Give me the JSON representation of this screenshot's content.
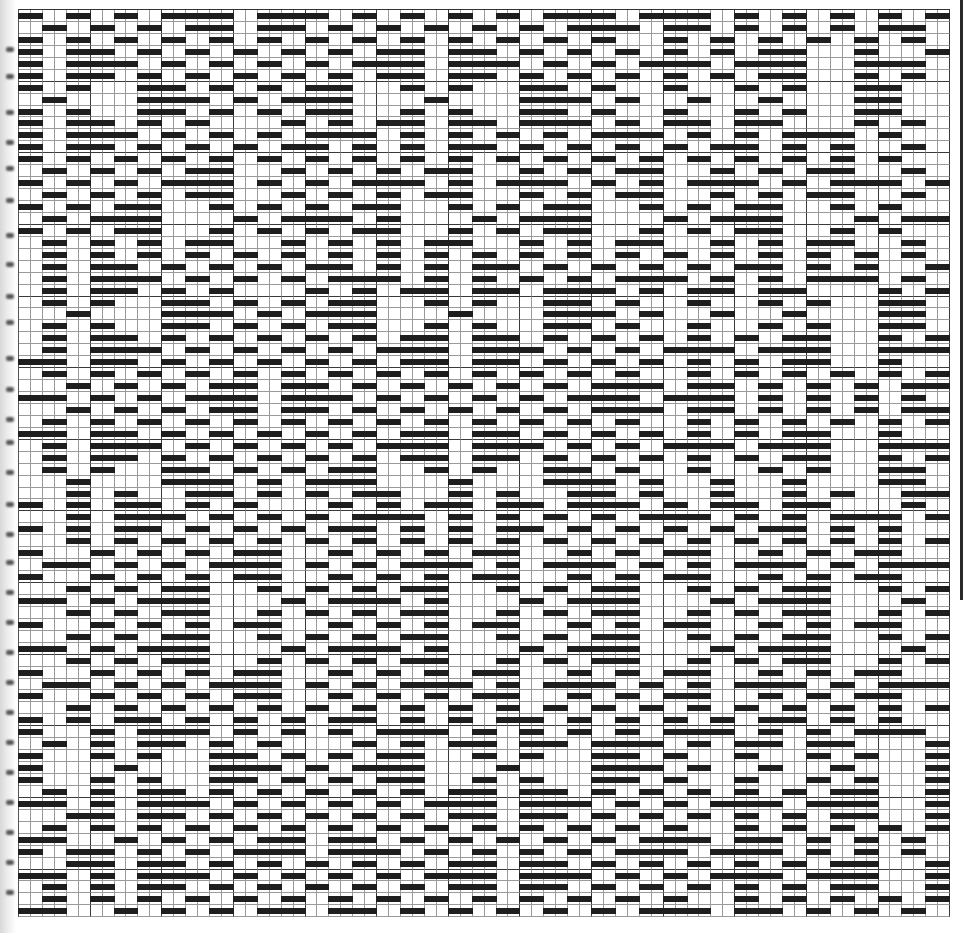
{
  "document": {
    "type": "weaving-drawdown-grid",
    "columns": 78,
    "rows": 76,
    "cell_width_px": 11.95,
    "cell_height_px": 11.95,
    "major_line_every": 6,
    "fill_color": "#1e1e1e",
    "grid_line_color": "#9a9a9a",
    "major_line_color": "#3a3a3a",
    "background": "#ffffff"
  },
  "base_rows": [
    [
      [
        0,
        1
      ],
      [
        4,
        5
      ],
      [
        8,
        9
      ],
      [
        12,
        17
      ],
      [
        20,
        25
      ],
      [
        28,
        29
      ],
      [
        32,
        33
      ],
      [
        36,
        37
      ],
      [
        40,
        41
      ],
      [
        44,
        49
      ],
      [
        52,
        57
      ],
      [
        60,
        61
      ],
      [
        64,
        65
      ],
      [
        68,
        69
      ],
      [
        72,
        73
      ],
      [
        76,
        77
      ]
    ],
    [
      [
        2,
        3
      ],
      [
        6,
        7
      ],
      [
        10,
        11
      ],
      [
        14,
        17
      ],
      [
        20,
        23
      ],
      [
        26,
        27
      ],
      [
        30,
        31
      ],
      [
        34,
        35
      ],
      [
        38,
        39
      ],
      [
        42,
        43
      ],
      [
        46,
        51
      ],
      [
        54,
        57
      ],
      [
        60,
        61
      ],
      [
        64,
        65
      ],
      [
        68,
        69
      ],
      [
        72,
        75
      ]
    ],
    [
      [
        0,
        1
      ],
      [
        4,
        5
      ],
      [
        8,
        9
      ],
      [
        12,
        13
      ],
      [
        16,
        17
      ],
      [
        20,
        21
      ],
      [
        24,
        25
      ],
      [
        28,
        29
      ],
      [
        32,
        33
      ],
      [
        36,
        37
      ],
      [
        40,
        41
      ],
      [
        44,
        45
      ],
      [
        48,
        49
      ],
      [
        54,
        55
      ],
      [
        58,
        59
      ],
      [
        62,
        63
      ],
      [
        66,
        67
      ],
      [
        70,
        71
      ],
      [
        74,
        75
      ]
    ],
    [
      [
        0,
        1
      ],
      [
        4,
        7
      ],
      [
        10,
        11
      ],
      [
        14,
        15
      ],
      [
        18,
        19
      ],
      [
        22,
        23
      ],
      [
        26,
        27
      ],
      [
        30,
        33
      ],
      [
        36,
        39
      ],
      [
        42,
        43
      ],
      [
        46,
        47
      ],
      [
        50,
        51
      ],
      [
        54,
        55
      ],
      [
        58,
        59
      ],
      [
        62,
        65
      ],
      [
        70,
        71
      ],
      [
        76,
        77
      ]
    ],
    [
      [
        0,
        1
      ],
      [
        4,
        9
      ],
      [
        12,
        13
      ],
      [
        16,
        17
      ],
      [
        20,
        21
      ],
      [
        24,
        25
      ],
      [
        28,
        33
      ],
      [
        36,
        39
      ],
      [
        40,
        41
      ],
      [
        44,
        45
      ],
      [
        48,
        49
      ],
      [
        52,
        57
      ],
      [
        60,
        65
      ],
      [
        70,
        75
      ]
    ],
    [
      [
        0,
        1
      ],
      [
        4,
        7
      ],
      [
        10,
        11
      ],
      [
        14,
        15
      ],
      [
        18,
        19
      ],
      [
        22,
        23
      ],
      [
        26,
        27
      ],
      [
        30,
        33
      ],
      [
        36,
        39
      ],
      [
        42,
        43
      ],
      [
        46,
        47
      ],
      [
        50,
        51
      ],
      [
        54,
        55
      ],
      [
        58,
        59
      ],
      [
        62,
        65
      ],
      [
        70,
        71
      ],
      [
        74,
        75
      ]
    ],
    [
      [
        0,
        1
      ],
      [
        4,
        5
      ],
      [
        10,
        13
      ],
      [
        16,
        17
      ],
      [
        20,
        21
      ],
      [
        24,
        27
      ],
      [
        32,
        33
      ],
      [
        36,
        37
      ],
      [
        42,
        45
      ],
      [
        48,
        49
      ],
      [
        54,
        55
      ],
      [
        60,
        61
      ],
      [
        64,
        65
      ],
      [
        70,
        73
      ]
    ],
    [
      [
        2,
        3
      ],
      [
        10,
        15
      ],
      [
        18,
        19
      ],
      [
        22,
        27
      ],
      [
        34,
        35
      ],
      [
        42,
        47
      ],
      [
        50,
        51
      ],
      [
        56,
        57
      ],
      [
        62,
        63
      ],
      [
        70,
        73
      ]
    ],
    [
      [
        0,
        1
      ],
      [
        4,
        5
      ],
      [
        10,
        13
      ],
      [
        16,
        17
      ],
      [
        20,
        21
      ],
      [
        24,
        27
      ],
      [
        32,
        33
      ],
      [
        36,
        37
      ],
      [
        42,
        45
      ],
      [
        48,
        49
      ],
      [
        54,
        55
      ],
      [
        60,
        61
      ],
      [
        64,
        65
      ],
      [
        70,
        73
      ]
    ],
    [
      [
        0,
        1
      ],
      [
        4,
        7
      ],
      [
        10,
        11
      ],
      [
        14,
        15
      ],
      [
        22,
        23
      ],
      [
        26,
        27
      ],
      [
        30,
        33
      ],
      [
        36,
        39
      ],
      [
        42,
        47
      ],
      [
        50,
        51
      ],
      [
        54,
        57
      ],
      [
        60,
        63
      ],
      [
        70,
        71
      ],
      [
        74,
        75
      ]
    ],
    [
      [
        0,
        1
      ],
      [
        4,
        9
      ],
      [
        12,
        13
      ],
      [
        16,
        17
      ],
      [
        20,
        21
      ],
      [
        24,
        29
      ],
      [
        32,
        33
      ],
      [
        36,
        37
      ],
      [
        40,
        41
      ],
      [
        44,
        45
      ],
      [
        48,
        53
      ],
      [
        56,
        57
      ],
      [
        60,
        61
      ],
      [
        64,
        69
      ],
      [
        72,
        73
      ]
    ],
    [
      [
        0,
        1
      ],
      [
        4,
        7
      ],
      [
        10,
        11
      ],
      [
        14,
        15
      ],
      [
        18,
        19
      ],
      [
        22,
        25
      ],
      [
        28,
        29
      ],
      [
        32,
        33
      ],
      [
        36,
        39
      ],
      [
        42,
        43
      ],
      [
        46,
        47
      ],
      [
        50,
        51
      ],
      [
        54,
        55
      ],
      [
        58,
        61
      ],
      [
        64,
        65
      ],
      [
        68,
        69
      ],
      [
        74,
        75
      ]
    ],
    [
      [
        0,
        1
      ],
      [
        4,
        5
      ],
      [
        8,
        9
      ],
      [
        12,
        13
      ],
      [
        16,
        17
      ],
      [
        20,
        21
      ],
      [
        24,
        25
      ],
      [
        28,
        29
      ],
      [
        32,
        33
      ],
      [
        36,
        37
      ],
      [
        40,
        41
      ],
      [
        44,
        45
      ],
      [
        48,
        49
      ],
      [
        52,
        53
      ],
      [
        56,
        57
      ],
      [
        60,
        61
      ],
      [
        64,
        65
      ],
      [
        68,
        69
      ],
      [
        72,
        73
      ]
    ],
    [
      [
        2,
        3
      ],
      [
        6,
        7
      ],
      [
        10,
        11
      ],
      [
        14,
        17
      ],
      [
        22,
        23
      ],
      [
        26,
        27
      ],
      [
        30,
        31
      ],
      [
        34,
        37
      ],
      [
        42,
        43
      ],
      [
        46,
        47
      ],
      [
        50,
        53
      ],
      [
        58,
        59
      ],
      [
        62,
        63
      ],
      [
        66,
        69
      ],
      [
        74,
        75
      ]
    ],
    [
      [
        0,
        1
      ],
      [
        4,
        5
      ],
      [
        8,
        9
      ],
      [
        12,
        17
      ],
      [
        20,
        21
      ],
      [
        24,
        25
      ],
      [
        28,
        33
      ],
      [
        36,
        37
      ],
      [
        40,
        45
      ],
      [
        48,
        49
      ],
      [
        52,
        53
      ],
      [
        56,
        61
      ],
      [
        64,
        65
      ],
      [
        68,
        73
      ],
      [
        76,
        77
      ]
    ],
    [
      [
        2,
        3
      ],
      [
        6,
        7
      ],
      [
        10,
        11
      ],
      [
        14,
        17
      ],
      [
        22,
        23
      ],
      [
        26,
        27
      ],
      [
        30,
        31
      ],
      [
        34,
        37
      ],
      [
        42,
        43
      ],
      [
        46,
        47
      ],
      [
        50,
        53
      ],
      [
        58,
        59
      ],
      [
        62,
        63
      ],
      [
        66,
        69
      ],
      [
        74,
        75
      ]
    ],
    [
      [
        0,
        1
      ],
      [
        4,
        5
      ],
      [
        8,
        11
      ],
      [
        16,
        17
      ],
      [
        20,
        21
      ],
      [
        24,
        25
      ],
      [
        28,
        31
      ],
      [
        36,
        37
      ],
      [
        40,
        41
      ],
      [
        44,
        47
      ],
      [
        52,
        53
      ],
      [
        56,
        57
      ],
      [
        60,
        63
      ],
      [
        68,
        69
      ],
      [
        72,
        73
      ]
    ],
    [
      [
        2,
        3
      ],
      [
        6,
        11
      ],
      [
        18,
        19
      ],
      [
        22,
        27
      ],
      [
        30,
        31
      ],
      [
        38,
        39
      ],
      [
        42,
        47
      ],
      [
        54,
        55
      ],
      [
        58,
        63
      ],
      [
        70,
        71
      ],
      [
        74,
        77
      ]
    ],
    [
      [
        0,
        1
      ],
      [
        4,
        5
      ],
      [
        8,
        11
      ],
      [
        16,
        17
      ],
      [
        20,
        21
      ],
      [
        24,
        25
      ],
      [
        28,
        31
      ],
      [
        36,
        37
      ],
      [
        40,
        41
      ],
      [
        44,
        47
      ],
      [
        52,
        53
      ],
      [
        56,
        57
      ],
      [
        60,
        63
      ],
      [
        68,
        69
      ],
      [
        72,
        73
      ]
    ],
    [
      [
        2,
        3
      ],
      [
        6,
        7
      ],
      [
        10,
        11
      ],
      [
        14,
        17
      ],
      [
        22,
        23
      ],
      [
        26,
        27
      ],
      [
        30,
        31
      ],
      [
        34,
        37
      ],
      [
        42,
        43
      ],
      [
        46,
        47
      ],
      [
        50,
        53
      ],
      [
        58,
        59
      ],
      [
        62,
        63
      ],
      [
        66,
        69
      ],
      [
        74,
        75
      ]
    ]
  ],
  "row_sequence": [
    0,
    1,
    2,
    3,
    4,
    5,
    6,
    7,
    8,
    9,
    10,
    11,
    12,
    13,
    14,
    15,
    16,
    17,
    18,
    19,
    12,
    11,
    10,
    9,
    8,
    7,
    6,
    5,
    4,
    3,
    2,
    1,
    0,
    1,
    2,
    3,
    4,
    5,
    6,
    7,
    8,
    9,
    10,
    11,
    12,
    13,
    14,
    15,
    16,
    17,
    18,
    19,
    18,
    17,
    16,
    15,
    14,
    13,
    12,
    11,
    10,
    9,
    8,
    7,
    6,
    5,
    4,
    3,
    2,
    1,
    0,
    3,
    4,
    5,
    2,
    1
  ],
  "row_shift": [
    0,
    0,
    0,
    0,
    0,
    0,
    0,
    0,
    0,
    0,
    0,
    0,
    0,
    0,
    0,
    0,
    0,
    0,
    0,
    0,
    2,
    2,
    2,
    2,
    2,
    2,
    2,
    2,
    2,
    2,
    2,
    2,
    2,
    2,
    2,
    2,
    2,
    2,
    2,
    2,
    4,
    4,
    4,
    4,
    4,
    4,
    4,
    4,
    4,
    4,
    4,
    4,
    4,
    4,
    4,
    4,
    4,
    4,
    4,
    4,
    6,
    6,
    6,
    6,
    6,
    6,
    6,
    6,
    6,
    6,
    6,
    6,
    6,
    6,
    6,
    6
  ],
  "binding_mark_ys": [
    47,
    74,
    110,
    140,
    166,
    198,
    233,
    262,
    294,
    320,
    356,
    387,
    417,
    440,
    470,
    502,
    532,
    560,
    590,
    620,
    650,
    680,
    710,
    740,
    770,
    800,
    830,
    860,
    890
  ]
}
